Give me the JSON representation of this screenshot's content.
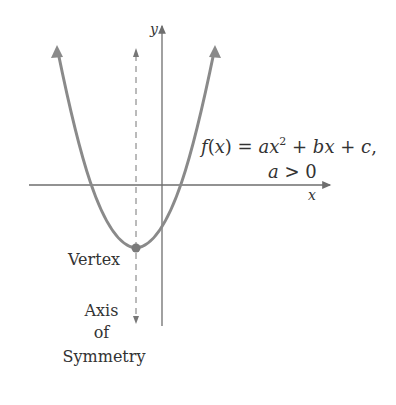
{
  "diagram": {
    "axis_labels": {
      "x": "x",
      "y": "y"
    },
    "function_label": {
      "f": "f",
      "paren_open": "(",
      "x": "x",
      "paren_close": ")",
      "eq": " = ",
      "a": "a",
      "x2": "x",
      "exp": "2",
      "plus1": " + ",
      "b": "b",
      "x3": "x",
      "plus2": " + ",
      "c": "c",
      "comma": ",",
      "cond_a": "a",
      "cond_rest": " > 0"
    },
    "vertex_label": "Vertex",
    "axis_of_symmetry_label": [
      "Axis",
      "of",
      "Symmetry"
    ],
    "colors": {
      "curve": "#8a8a8a",
      "axes": "#6e6e6e",
      "text": "#333333"
    }
  }
}
